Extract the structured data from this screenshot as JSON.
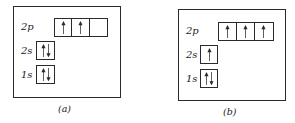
{
  "diagrams": [
    {
      "id": "a",
      "caption": "(a)",
      "orbitals": [
        {
          "label": "2p",
          "cells": [
            "up",
            "up",
            "empty"
          ]
        },
        {
          "label": "2s",
          "cells": [
            "updown"
          ]
        },
        {
          "label": "1s",
          "cells": [
            "updown"
          ]
        }
      ]
    },
    {
      "id": "b",
      "caption": "(b)",
      "orbitals": [
        {
          "label": "2p",
          "cells": [
            "up",
            "up",
            "up"
          ]
        },
        {
          "label": "2s",
          "cells": [
            "up"
          ]
        },
        {
          "label": "1s",
          "cells": [
            "updown"
          ]
        }
      ]
    }
  ],
  "colors": {
    "line": "#2a2a2a",
    "background": "#ffffff"
  }
}
